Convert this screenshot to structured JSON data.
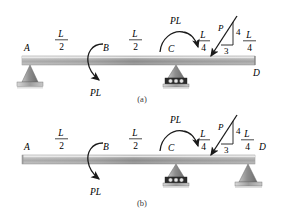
{
  "figure": {
    "type": "engineering-beam-diagram",
    "caption_a": "(a)",
    "caption_b": "(b)",
    "colors": {
      "beam_light": "#efefef",
      "beam_mid": "#9a9a9a",
      "beam_dark": "#6f6f6f",
      "support_fill": "#8d8d8d",
      "ink": "#1a1a1a",
      "background": "#ffffff"
    }
  },
  "diagrams": [
    {
      "id": "a",
      "caption": "(a)",
      "points": [
        {
          "label": "A",
          "support": "pin"
        },
        {
          "label": "B",
          "support": "none"
        },
        {
          "label": "C",
          "support": "roller"
        },
        {
          "label": "D",
          "support": "none"
        }
      ],
      "dimensions": [
        {
          "numerator": "L",
          "denominator": "2",
          "span": "A-B"
        },
        {
          "numerator": "L",
          "denominator": "2",
          "span": "B-C"
        },
        {
          "numerator": "L",
          "denominator": "4",
          "span": "C-P"
        },
        {
          "numerator": "L",
          "denominator": "4",
          "span": "P-D"
        }
      ],
      "loads": [
        {
          "kind": "moment",
          "at": "B",
          "label": "PL",
          "direction": "counterclockwise-arc-arrow-down"
        },
        {
          "kind": "moment",
          "at": "C",
          "label": "PL",
          "direction": "clockwise-arc-arrow-right"
        },
        {
          "kind": "force",
          "label": "P",
          "slope_rise": "4",
          "slope_run": "3",
          "direction": "down-left"
        }
      ]
    },
    {
      "id": "b",
      "caption": "(b)",
      "points": [
        {
          "label": "A",
          "support": "none"
        },
        {
          "label": "B",
          "support": "none"
        },
        {
          "label": "C",
          "support": "roller"
        },
        {
          "label": "D",
          "support": "pin"
        }
      ],
      "dimensions": [
        {
          "numerator": "L",
          "denominator": "2",
          "span": "A-B"
        },
        {
          "numerator": "L",
          "denominator": "2",
          "span": "B-C"
        },
        {
          "numerator": "L",
          "denominator": "4",
          "span": "C-P"
        },
        {
          "numerator": "L",
          "denominator": "4",
          "span": "P-D"
        }
      ],
      "loads": [
        {
          "kind": "moment",
          "at": "B",
          "label": "PL",
          "direction": "counterclockwise-arc-arrow-down"
        },
        {
          "kind": "moment",
          "at": "C",
          "label": "PL",
          "direction": "clockwise-arc-arrow-right"
        },
        {
          "kind": "force",
          "label": "P",
          "slope_rise": "4",
          "slope_run": "3",
          "direction": "down-left"
        }
      ]
    }
  ],
  "labels": {
    "A": "A",
    "B": "B",
    "C": "C",
    "D": "D",
    "L": "L",
    "two": "2",
    "four": "4",
    "three": "3",
    "PL": "PL",
    "P": "P",
    "slope_rise": "4",
    "slope_run": "3",
    "caption_a": "(a)",
    "caption_b": "(b)"
  }
}
